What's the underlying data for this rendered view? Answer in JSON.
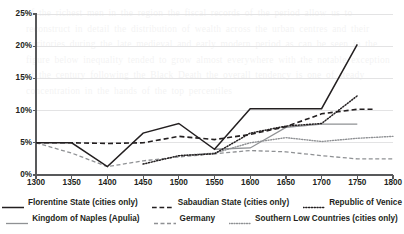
{
  "chart_data": {
    "type": "line",
    "title": "",
    "xlabel": "",
    "ylabel": "",
    "xlim": [
      1300,
      1800
    ],
    "ylim": [
      0,
      25
    ],
    "ytick_format": "percent",
    "grid": true,
    "grid_axis": "y",
    "legend_position": "bottom",
    "x_ticks": [
      1300,
      1350,
      1400,
      1450,
      1500,
      1550,
      1600,
      1650,
      1700,
      1750,
      1800
    ],
    "x_tick_labels": [
      "1300",
      "1350",
      "1400",
      "1450",
      "1500",
      "1550",
      "1600",
      "1650",
      "1700",
      "1750",
      "1800"
    ],
    "y_ticks": [
      0,
      5,
      10,
      15,
      20,
      25
    ],
    "y_tick_labels": [
      "0%",
      "5%",
      "10%",
      "15%",
      "20%",
      "25%"
    ],
    "series": [
      {
        "name": "Florentine State (cities only)",
        "style": "solid",
        "color": "#231f20",
        "width": 1.5,
        "x": [
          1300,
          1350,
          1400,
          1450,
          1500,
          1550,
          1600,
          1650,
          1700,
          1750
        ],
        "values": [
          5.0,
          5.0,
          1.3,
          6.5,
          8.0,
          4.0,
          10.3,
          10.3,
          10.3,
          20.3
        ]
      },
      {
        "name": "Sabaudian State (cities only)",
        "style": "dashed",
        "color": "#231f20",
        "width": 1.6,
        "x": [
          1300,
          1350,
          1400,
          1450,
          1500,
          1550,
          1600,
          1650,
          1700,
          1750,
          1775
        ],
        "values": [
          5.0,
          5.0,
          4.9,
          5.0,
          6.0,
          5.5,
          6.3,
          7.5,
          9.5,
          10.2,
          10.2
        ]
      },
      {
        "name": "Republic of Venice",
        "style": "dotted",
        "color": "#231f20",
        "width": 1.5,
        "x": [
          1450,
          1500,
          1550,
          1600,
          1650,
          1700,
          1750
        ],
        "values": [
          1.7,
          3.0,
          3.3,
          6.5,
          7.6,
          8.0,
          12.3
        ]
      },
      {
        "name": "Kingdom of Naples (Apulia)",
        "style": "solid",
        "color": "#8f9194",
        "width": 1.3,
        "x": [
          1550,
          1600,
          1650,
          1700,
          1750
        ],
        "values": [
          4.0,
          4.2,
          7.4,
          7.9,
          7.9
        ]
      },
      {
        "name": "Germany",
        "style": "dashed",
        "color": "#8f9194",
        "width": 1.3,
        "x": [
          1300,
          1350,
          1400,
          1450,
          1500,
          1550,
          1600,
          1650,
          1700,
          1750,
          1800
        ],
        "values": [
          5.0,
          3.4,
          1.3,
          2.2,
          2.8,
          3.3,
          3.8,
          3.6,
          3.0,
          2.5,
          2.5
        ]
      },
      {
        "name": "Southern Low Countries (cities only)",
        "style": "dotted",
        "color": "#8f9194",
        "width": 1.4,
        "x": [
          1500,
          1550,
          1600,
          1650,
          1700,
          1750,
          1800
        ],
        "values": [
          3.0,
          3.4,
          5.0,
          5.8,
          5.2,
          5.7,
          6.0
        ]
      }
    ]
  },
  "legend": {
    "rows": [
      [
        {
          "label": "Florentine State (cities only)",
          "style": "solid",
          "color": "#231f20"
        },
        {
          "label": "Sabaudian State (cities only)",
          "style": "dashed",
          "color": "#231f20"
        },
        {
          "label": "Republic of Venice",
          "style": "dotted",
          "color": "#231f20"
        }
      ],
      [
        {
          "label": "Kingdom of Naples (Apulia)",
          "style": "solid",
          "color": "#8f9194"
        },
        {
          "label": "Germany",
          "style": "dashed",
          "color": "#8f9194"
        },
        {
          "label": "Southern Low Countries (cities only)",
          "style": "dotted",
          "color": "#8f9194"
        }
      ]
    ]
  },
  "colors": {
    "axis": "#58595b",
    "grid": "#e3e3e4",
    "ink_black": "#231f20",
    "ink_gray": "#8f9194",
    "background": "#ffffff"
  },
  "background_text": "of the richest men in the region  the fiscal records of the period allow us to reconstruct in detail the distribution of wealth across the urban centres and their territories  during the late medieval and early modern period  as can be seen in the figure below  inequality tended to grow almost everywhere  with the notable exception of the century following the Black Death  the overall tendency is one of steady concentration in the hands of the top percentiles"
}
